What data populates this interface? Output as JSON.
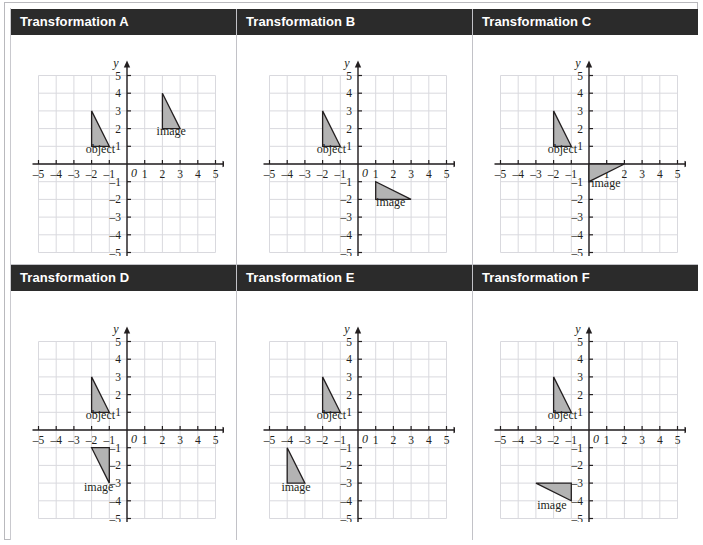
{
  "figure": {
    "title": "",
    "colors": {
      "header_bg": "#2b2b2b",
      "header_text": "#ffffff",
      "grid_line": "#d9d9de",
      "axis": "#231f20",
      "shape_fill": "#b3b3b3",
      "shape_stroke": "#231f20",
      "panel_border": "#c2c2c7"
    },
    "axis": {
      "x_label": "x",
      "y_label": "y",
      "origin_label": "0",
      "xlim": [
        -5,
        5
      ],
      "ylim": [
        -5,
        5
      ],
      "x_ticks": [
        "–5",
        "–4",
        "–3",
        "–2",
        "–1",
        "1",
        "2",
        "3",
        "4",
        "5"
      ],
      "y_ticks": [
        "5",
        "4",
        "3",
        "2",
        "1",
        "–1",
        "–2",
        "–3",
        "–4",
        "–5"
      ],
      "grid": true
    },
    "labels": {
      "object": "object",
      "image": "image"
    }
  },
  "panels": [
    {
      "id": "A",
      "title": "Transformation A",
      "object": {
        "label": "object",
        "points": [
          [
            -2,
            3
          ],
          [
            -2,
            1
          ],
          [
            -1,
            1
          ]
        ],
        "label_at": [
          -1.5,
          0.62
        ]
      },
      "image": {
        "label": "image",
        "points": [
          [
            2,
            4
          ],
          [
            2,
            2
          ],
          [
            3,
            2
          ]
        ],
        "label_at": [
          2.5,
          1.62
        ]
      }
    },
    {
      "id": "B",
      "title": "Transformation B",
      "object": {
        "label": "object",
        "points": [
          [
            -2,
            3
          ],
          [
            -2,
            1
          ],
          [
            -1,
            1
          ]
        ],
        "label_at": [
          -1.5,
          0.62
        ]
      },
      "image": {
        "label": "image",
        "points": [
          [
            1,
            -1
          ],
          [
            1,
            -2
          ],
          [
            3,
            -2
          ]
        ],
        "label_at": [
          1.85,
          -2.4
        ]
      }
    },
    {
      "id": "C",
      "title": "Transformation C",
      "object": {
        "label": "object",
        "points": [
          [
            -2,
            3
          ],
          [
            -2,
            1
          ],
          [
            -1,
            1
          ]
        ],
        "label_at": [
          -1.5,
          0.62
        ]
      },
      "image": {
        "label": "image",
        "points": [
          [
            0,
            0
          ],
          [
            0,
            -1
          ],
          [
            2,
            0
          ]
        ],
        "label_at": [
          0.95,
          -1.28
        ]
      }
    },
    {
      "id": "D",
      "title": "Transformation D",
      "object": {
        "label": "object",
        "points": [
          [
            -2,
            3
          ],
          [
            -2,
            1
          ],
          [
            -1,
            1
          ]
        ],
        "label_at": [
          -1.5,
          0.62
        ]
      },
      "image": {
        "label": "image",
        "points": [
          [
            -2,
            -1
          ],
          [
            -1,
            -1
          ],
          [
            -1,
            -3
          ]
        ],
        "label_at": [
          -1.6,
          -3.42
        ]
      }
    },
    {
      "id": "E",
      "title": "Transformation E",
      "object": {
        "label": "object",
        "points": [
          [
            -2,
            3
          ],
          [
            -2,
            1
          ],
          [
            -1,
            1
          ]
        ],
        "label_at": [
          -1.5,
          0.62
        ]
      },
      "image": {
        "label": "image",
        "points": [
          [
            -4,
            -1
          ],
          [
            -4,
            -3
          ],
          [
            -3,
            -3
          ]
        ],
        "label_at": [
          -3.5,
          -3.42
        ]
      }
    },
    {
      "id": "F",
      "title": "Transformation F",
      "object": {
        "label": "object",
        "points": [
          [
            -2,
            3
          ],
          [
            -2,
            1
          ],
          [
            -1,
            1
          ]
        ],
        "label_at": [
          -1.5,
          0.62
        ]
      },
      "image": {
        "label": "image",
        "points": [
          [
            -3,
            -3
          ],
          [
            -1,
            -3
          ],
          [
            -1,
            -4
          ]
        ],
        "label_at": [
          -2.1,
          -4.45
        ]
      }
    }
  ],
  "chart_data": {
    "type": "scatter",
    "xlabel": "x",
    "ylabel": "y",
    "xlim": [
      -5,
      5
    ],
    "ylim": [
      -5,
      5
    ],
    "grid": true,
    "legend": "none",
    "series": [
      {
        "name": "Transformation A – object",
        "values": [
          [
            -2,
            3
          ],
          [
            -2,
            1
          ],
          [
            -1,
            1
          ]
        ]
      },
      {
        "name": "Transformation A – image",
        "values": [
          [
            2,
            4
          ],
          [
            2,
            2
          ],
          [
            3,
            2
          ]
        ]
      },
      {
        "name": "Transformation B – object",
        "values": [
          [
            -2,
            3
          ],
          [
            -2,
            1
          ],
          [
            -1,
            1
          ]
        ]
      },
      {
        "name": "Transformation B – image",
        "values": [
          [
            1,
            -1
          ],
          [
            1,
            -2
          ],
          [
            3,
            -2
          ]
        ]
      },
      {
        "name": "Transformation C – object",
        "values": [
          [
            -2,
            3
          ],
          [
            -2,
            1
          ],
          [
            -1,
            1
          ]
        ]
      },
      {
        "name": "Transformation C – image",
        "values": [
          [
            0,
            0
          ],
          [
            0,
            -1
          ],
          [
            2,
            0
          ]
        ]
      },
      {
        "name": "Transformation D – object",
        "values": [
          [
            -2,
            3
          ],
          [
            -2,
            1
          ],
          [
            -1,
            1
          ]
        ]
      },
      {
        "name": "Transformation D – image",
        "values": [
          [
            -2,
            -1
          ],
          [
            -1,
            -1
          ],
          [
            -1,
            -3
          ]
        ]
      },
      {
        "name": "Transformation E – object",
        "values": [
          [
            -2,
            3
          ],
          [
            -2,
            1
          ],
          [
            -1,
            1
          ]
        ]
      },
      {
        "name": "Transformation E – image",
        "values": [
          [
            -4,
            -1
          ],
          [
            -4,
            -3
          ],
          [
            -3,
            -3
          ]
        ]
      },
      {
        "name": "Transformation F – object",
        "values": [
          [
            -2,
            3
          ],
          [
            -2,
            1
          ],
          [
            -1,
            1
          ]
        ]
      },
      {
        "name": "Transformation F – image",
        "values": [
          [
            -3,
            -3
          ],
          [
            -1,
            -3
          ],
          [
            -1,
            -4
          ]
        ]
      }
    ]
  }
}
